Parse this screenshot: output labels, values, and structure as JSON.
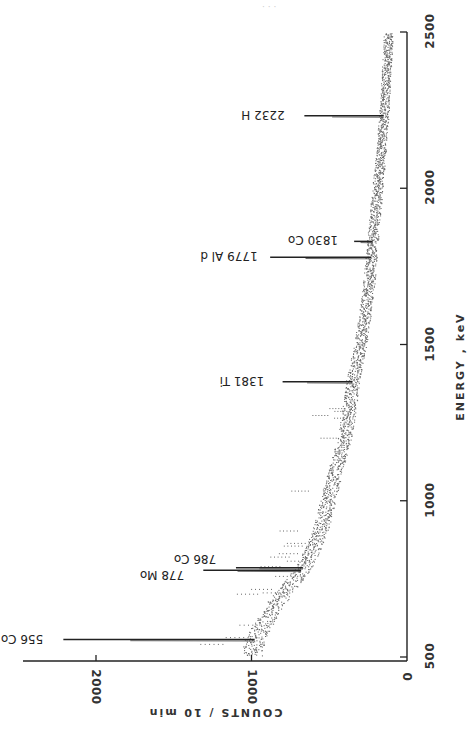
{
  "header_faint_text": "· · ·",
  "chart_data": {
    "type": "scatter",
    "orientation": "rotated-90-clockwise",
    "title": "",
    "xlabel": "ENERGY , keV",
    "ylabel": "COUNTS / 10 min",
    "xlim": [
      500,
      2500
    ],
    "ylim": [
      0,
      2300
    ],
    "x_ticks": [
      500,
      1000,
      1500,
      2000,
      2500
    ],
    "y_ticks": [
      0,
      1000,
      2000
    ],
    "grid": false,
    "legend": null,
    "background_continuum": {
      "energy_keV": [
        500,
        556,
        600,
        650,
        700,
        750,
        800,
        850,
        900,
        1000,
        1100,
        1200,
        1300,
        1381,
        1500,
        1600,
        1700,
        1779,
        1900,
        2000,
        2100,
        2232,
        2350,
        2500
      ],
      "counts": [
        1000,
        980,
        930,
        870,
        800,
        720,
        650,
        600,
        560,
        510,
        460,
        400,
        370,
        350,
        300,
        270,
        245,
        230,
        210,
        190,
        170,
        150,
        135,
        120
      ]
    },
    "peaks": [
      {
        "label": "556 Co",
        "energy_keV": 556,
        "counts": 2210
      },
      {
        "label": "778 Mo",
        "energy_keV": 778,
        "counts": 1310
      },
      {
        "label": "786 Co",
        "energy_keV": 786,
        "counts": 1100
      },
      {
        "label": "1381 Ti",
        "energy_keV": 1381,
        "counts": 800
      },
      {
        "label": "1779 Al d",
        "energy_keV": 1779,
        "counts": 880
      },
      {
        "label": "1830 Co",
        "energy_keV": 1830,
        "counts": 340
      },
      {
        "label": "2232 H",
        "energy_keV": 2232,
        "counts": 660
      }
    ]
  },
  "axes": {
    "energy": {
      "title": "ENERGY , keV",
      "ticks": [
        {
          "value": 500,
          "label": "500"
        },
        {
          "value": 1000,
          "label": "1000"
        },
        {
          "value": 1500,
          "label": "1500"
        },
        {
          "value": 2000,
          "label": "2000"
        },
        {
          "value": 2500,
          "label": "2500"
        }
      ]
    },
    "counts": {
      "title": "COUNTS / 10 min",
      "ticks": [
        {
          "value": 0,
          "label": "0"
        },
        {
          "value": 1000,
          "label": "1000"
        },
        {
          "value": 2000,
          "label": "2000"
        }
      ]
    }
  },
  "colors": {
    "ink": "#222222",
    "points": "#555555",
    "background": "#ffffff"
  }
}
